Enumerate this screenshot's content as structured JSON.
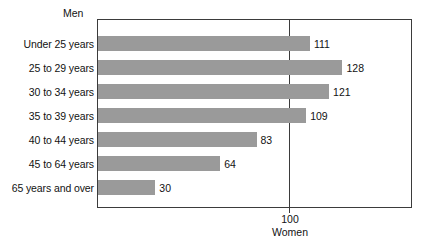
{
  "chart_data": {
    "type": "bar",
    "orientation": "horizontal",
    "title": "",
    "xlabel": "Women",
    "ylabel": "",
    "categories": [
      "Under 25 years",
      "25 to 29 years",
      "30 to 34 years",
      "35 to 39 years",
      "40 to 44 years",
      "45 to 64 years",
      "65 years and over"
    ],
    "values": [
      111,
      128,
      121,
      109,
      83,
      64,
      30
    ],
    "value_labels": [
      "111",
      "128",
      "121",
      "109",
      "83",
      "64",
      "30"
    ],
    "top_caption": "Men",
    "reference_line": {
      "value": 100,
      "label": "100",
      "axis_title": "Women"
    },
    "xlim": [
      0,
      165
    ],
    "grid": false,
    "legend": "none",
    "bar_color": "#9a9a9a",
    "axis_color": "#3b3b3b",
    "background_color": "#ffffff"
  }
}
